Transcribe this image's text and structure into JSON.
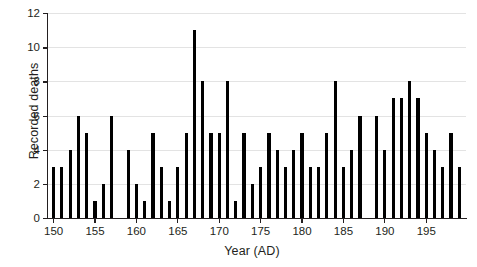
{
  "chart_data": {
    "type": "bar",
    "title": "",
    "xlabel": "Year (AD)",
    "ylabel": "Recorded deaths",
    "xlim": [
      149.2,
      199.8
    ],
    "ylim": [
      0,
      12
    ],
    "grid": true,
    "legend": null,
    "y_ticks": [
      0,
      2,
      4,
      6,
      8,
      10,
      12
    ],
    "y_tick_labels": [
      "0",
      "2",
      "4",
      "6",
      "8",
      "10",
      "12"
    ],
    "x_ticks": [
      150,
      155,
      160,
      165,
      170,
      175,
      180,
      185,
      190,
      195
    ],
    "x_tick_labels": [
      "150",
      "155",
      "160",
      "165",
      "170",
      "175",
      "180",
      "185",
      "190",
      "195"
    ],
    "bar_color": "#000000",
    "categories": [
      150,
      151,
      152,
      153,
      154,
      155,
      156,
      157,
      158,
      159,
      160,
      161,
      162,
      163,
      164,
      165,
      166,
      167,
      168,
      169,
      170,
      171,
      172,
      173,
      174,
      175,
      176,
      177,
      178,
      179,
      180,
      181,
      182,
      183,
      184,
      185,
      186,
      187,
      188,
      189,
      190,
      191,
      192,
      193,
      194,
      195,
      196,
      197,
      198,
      199
    ],
    "values": [
      3,
      3,
      4,
      6,
      5,
      1,
      2,
      6,
      0,
      4,
      2,
      1,
      5,
      3,
      1,
      3,
      5,
      11,
      8,
      5,
      5,
      8,
      1,
      5,
      2,
      3,
      5,
      4,
      3,
      4,
      5,
      3,
      3,
      5,
      8,
      3,
      4,
      6,
      0,
      6,
      4,
      7,
      7,
      8,
      7,
      5,
      4,
      3,
      5,
      3
    ]
  }
}
